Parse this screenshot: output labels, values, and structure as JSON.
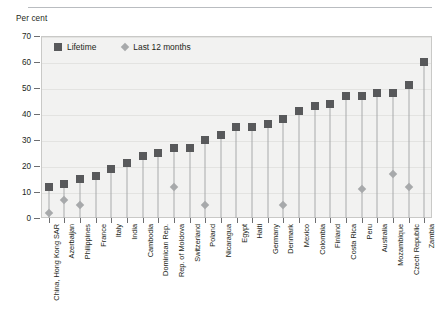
{
  "chart_data": {
    "type": "bar",
    "title": "",
    "subtitle": "",
    "xlabel": "",
    "ylabel": "Per cent",
    "ylim": [
      0,
      70
    ],
    "ytick_step": 10,
    "yticks": [
      0,
      10,
      20,
      30,
      40,
      50,
      60,
      70
    ],
    "grid": true,
    "legend_position": "top-left",
    "marker_style": "lollipop",
    "categories": [
      "China, Hong Kong SAR",
      "Azerbaijan",
      "Philippines",
      "France",
      "Italy",
      "India",
      "Cambodia",
      "Dominican Rep.",
      "Rep. of Moldova",
      "Switzerland",
      "Poland",
      "Nicaragua",
      "Egypt",
      "Haiti",
      "Germany",
      "Denmark",
      "Mexico",
      "Colombia",
      "Finland",
      "Costa Rica",
      "Peru",
      "Australia",
      "Mozambique",
      "Czech Republic",
      "Zambia"
    ],
    "series": [
      {
        "name": "Lifetime",
        "marker": "square",
        "color": "#58595b",
        "values": [
          12,
          13,
          15,
          16,
          19,
          21,
          24,
          25,
          27,
          27,
          30,
          32,
          35,
          35,
          36,
          38,
          41,
          43,
          44,
          47,
          47,
          48,
          48,
          51,
          60
        ]
      },
      {
        "name": "Last 12 months",
        "marker": "diamond",
        "color": "#a7a9ab",
        "values": [
          2,
          7,
          5,
          null,
          null,
          null,
          null,
          null,
          12,
          null,
          5,
          null,
          null,
          null,
          null,
          5,
          null,
          null,
          null,
          null,
          11,
          null,
          17,
          12,
          null
        ]
      }
    ]
  },
  "legend": {
    "items": [
      {
        "label": "Lifetime",
        "marker": "square-marker-icon"
      },
      {
        "label": "Last 12 months",
        "marker": "diamond-marker-icon"
      }
    ]
  }
}
